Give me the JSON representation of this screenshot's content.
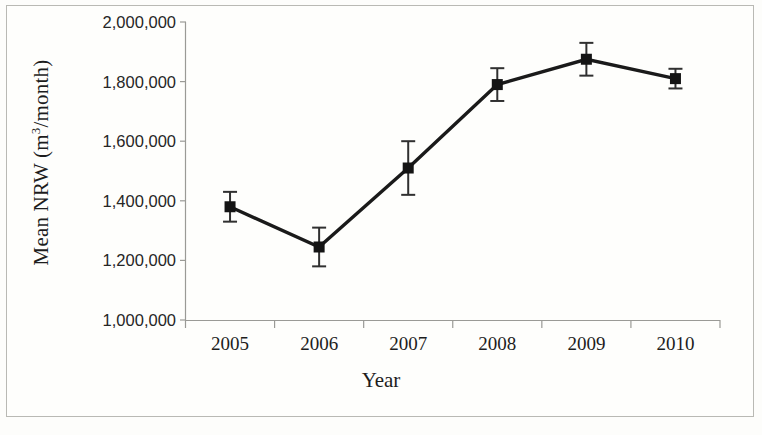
{
  "chart_data": {
    "type": "line",
    "title": "",
    "subtitle": "",
    "xlabel": "Year",
    "ylabel_plain": "Mean NRW (m3/month)",
    "ylabel_prefix": "Mean NRW (m",
    "ylabel_superscript": "3",
    "ylabel_suffix": "/month)",
    "categories": [
      "2005",
      "2006",
      "2007",
      "2008",
      "2009",
      "2010"
    ],
    "values": [
      1380000,
      1245000,
      1510000,
      1790000,
      1875000,
      1810000
    ],
    "errors": [
      50000,
      65000,
      90000,
      55000,
      55000,
      33000
    ],
    "series": [
      {
        "name": "Mean NRW",
        "values": [
          1380000,
          1245000,
          1510000,
          1790000,
          1875000,
          1810000
        ],
        "errors": [
          50000,
          65000,
          90000,
          55000,
          55000,
          33000
        ],
        "marker": "square",
        "color": "#141414"
      }
    ],
    "ylim": [
      1000000,
      2000000
    ],
    "ytick_values": [
      1000000,
      1200000,
      1400000,
      1600000,
      1800000,
      2000000
    ],
    "ytick_labels": [
      "1,000,000",
      "1,200,000",
      "1,400,000",
      "1,600,000",
      "1,800,000",
      "2,000,000"
    ],
    "xtick_labels": [
      "2005",
      "2006",
      "2007",
      "2008",
      "2009",
      "2010"
    ],
    "grid": false,
    "legend": false,
    "legend_position": "none",
    "error_bars": true,
    "colors": {
      "line": "#141414",
      "marker": "#141414",
      "errorbar": "#303030",
      "axis": "#9a9a96",
      "text": "#1d1d1d",
      "background": "#fefefc",
      "frame": "#b9b9b4"
    }
  }
}
